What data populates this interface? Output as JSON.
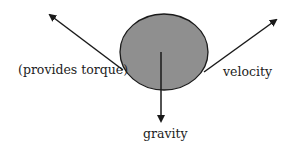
{
  "diagram": {
    "labels": {
      "torque": "(provides torque)",
      "velocity": "velocity",
      "gravity": "gravity"
    },
    "colors": {
      "ball_fill": "#8f8f8f",
      "stroke": "#1a1a1a"
    }
  }
}
